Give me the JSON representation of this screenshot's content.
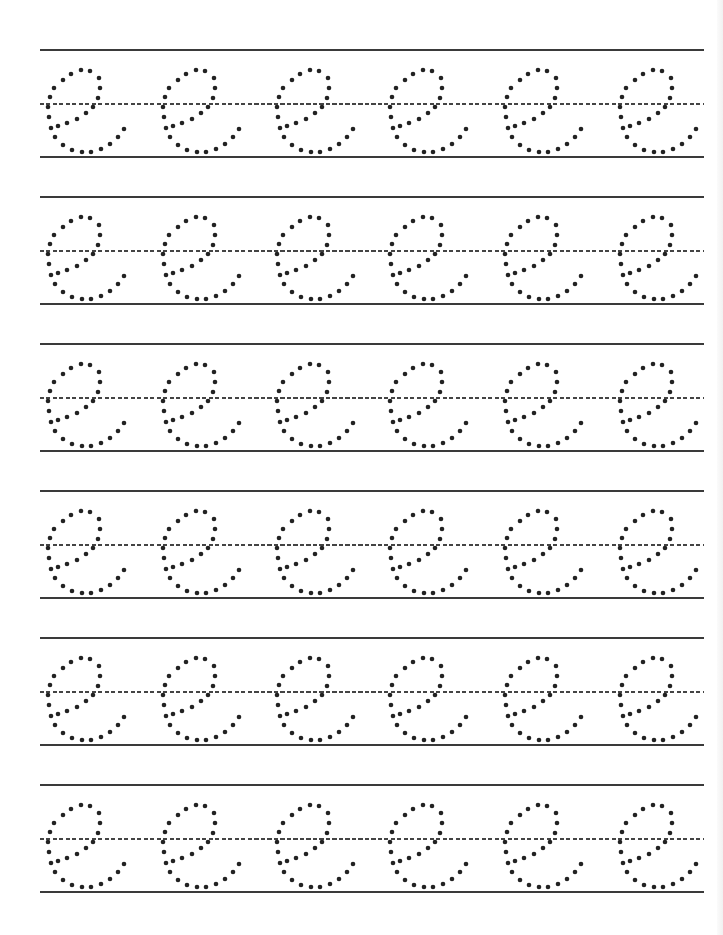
{
  "worksheet": {
    "letter": "e",
    "style": "cursive dotted tracing",
    "rows": 6,
    "letters_per_row": 6,
    "row_tops": [
      50,
      197,
      344,
      491,
      638,
      785
    ],
    "letter_lefts": [
      48,
      163,
      277,
      390,
      505,
      620
    ],
    "line_color": "#3a3a3a",
    "dot_color": "#222222",
    "dot_radius": 2.3
  }
}
